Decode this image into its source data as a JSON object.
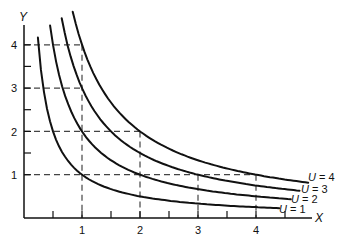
{
  "chart_data": {
    "type": "line",
    "title": "",
    "xlabel": "X",
    "ylabel": "Y",
    "xlim": [
      0,
      4.9
    ],
    "ylim": [
      0,
      4.5
    ],
    "x_ticks": [
      1,
      2,
      3,
      4
    ],
    "y_ticks": [
      1,
      2,
      3,
      4
    ],
    "x_minor_ticks": [
      0.5,
      1.5,
      2.5,
      3.5
    ],
    "y_minor_ticks": [
      1.5,
      2.5,
      3.5
    ],
    "grid": false,
    "legend": "inline labels at right end of curves",
    "series": [
      {
        "name": "U = 1",
        "U": 1,
        "function": "Y = 1/X",
        "x_range": [
          0.24,
          4.4
        ]
      },
      {
        "name": "U = 2",
        "U": 2,
        "function": "Y = 2/X",
        "x_range": [
          0.45,
          4.6
        ]
      },
      {
        "name": "U = 3",
        "U": 3,
        "function": "Y = 3/X",
        "x_range": [
          0.65,
          4.75
        ]
      },
      {
        "name": "U = 4",
        "U": 4,
        "function": "Y = 4/X",
        "x_range": [
          0.84,
          4.9
        ]
      }
    ],
    "reference_lines": [
      {
        "type": "horizontal",
        "y": 4,
        "x_from": 0,
        "x_to": 1,
        "style": "dashed"
      },
      {
        "type": "horizontal",
        "y": 3,
        "x_from": 0,
        "x_to": 1,
        "style": "dashed"
      },
      {
        "type": "horizontal",
        "y": 2,
        "x_from": 0,
        "x_to": 2,
        "style": "dashed"
      },
      {
        "type": "horizontal",
        "y": 1,
        "x_from": 0,
        "x_to": 4,
        "style": "dashed"
      },
      {
        "type": "vertical",
        "x": 1,
        "y_from": 0,
        "y_to": 4,
        "style": "dashed"
      },
      {
        "type": "vertical",
        "x": 2,
        "y_from": 0,
        "y_to": 2,
        "style": "dashed"
      },
      {
        "type": "vertical",
        "x": 3,
        "y_from": 0,
        "y_to": 1,
        "style": "dashed"
      },
      {
        "type": "vertical",
        "x": 4,
        "y_from": 0,
        "y_to": 1,
        "style": "dashed"
      }
    ],
    "line_color": "#111111",
    "dash_color": "#333333"
  },
  "labels": {
    "x_axis": "X",
    "y_axis": "Y",
    "x_ticks": [
      "1",
      "2",
      "3",
      "4"
    ],
    "y_ticks": [
      "1",
      "2",
      "3",
      "4"
    ],
    "curves": {
      "u1": {
        "u": "U",
        "eq": " = 1"
      },
      "u2": {
        "u": "U",
        "eq": " = 2"
      },
      "u3": {
        "u": "U",
        "eq": " = 3"
      },
      "u4": {
        "u": "U",
        "eq": " = 4"
      }
    }
  }
}
